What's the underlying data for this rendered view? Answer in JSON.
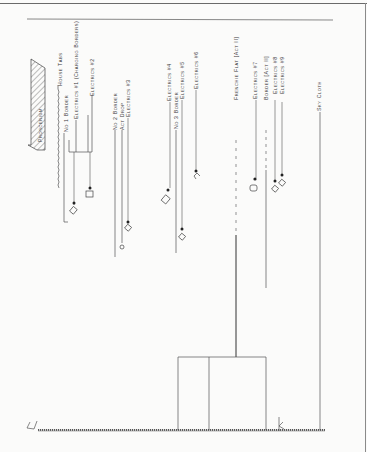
{
  "diagram": {
    "type": "theatre section hang plot (hand drawn)",
    "proscenium_label": "Proscenium",
    "stage_floor_label": "",
    "linesets": [
      {
        "label": "House Tabs",
        "x": 62
      },
      {
        "label": "No 1 Border",
        "x": 67
      },
      {
        "label": "Electrics #1 (Charging Borders)",
        "x": 77
      },
      {
        "label": "Electrics #2",
        "x": 92
      },
      {
        "label": "No 2 Border",
        "x": 116
      },
      {
        "label": "Act Drop",
        "x": 123
      },
      {
        "label": "Electrics #3",
        "x": 128
      },
      {
        "label": "Electrics #4",
        "x": 170
      },
      {
        "label": "No 3 Border",
        "x": 178
      },
      {
        "label": "Electrics #5",
        "x": 182
      },
      {
        "label": "Electrics #6",
        "x": 196
      },
      {
        "label": "Frenchie Flat [Act II]",
        "x": 236
      },
      {
        "label": "Electrics #7",
        "x": 256
      },
      {
        "label": "Border [Act II]",
        "x": 266
      },
      {
        "label": "Electrics #8",
        "x": 276
      },
      {
        "label": "Electrics #9",
        "x": 283
      },
      {
        "label": "Sky Cloth",
        "x": 320
      }
    ]
  }
}
